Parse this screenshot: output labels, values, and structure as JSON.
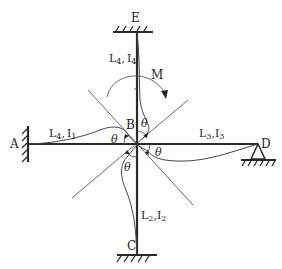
{
  "diagram": {
    "nodes": {
      "A": {
        "label": "A",
        "support": "fixed"
      },
      "B": {
        "label": "B",
        "support": "rigid joint"
      },
      "C": {
        "label": "C",
        "support": "fixed"
      },
      "D": {
        "label": "D",
        "support": "pin"
      },
      "E": {
        "label": "E",
        "support": "fixed"
      }
    },
    "members": {
      "AB": {
        "label": "L₁, I₁",
        "l_sub": "1",
        "i_sub": "1"
      },
      "BC": {
        "label": "L₂, I₂",
        "l_sub": "2",
        "i_sub": "2"
      },
      "BD": {
        "label": "L₃, I₃",
        "l_sub": "3",
        "i_sub": "3"
      },
      "BE": {
        "label": "L₄, I₄",
        "l_sub": "4",
        "i_sub": "4"
      }
    },
    "labels": {
      "A": "A",
      "B": "B",
      "C": "C",
      "D": "D",
      "E": "E",
      "moment": "M",
      "theta": "θ",
      "L": "L",
      "I": "I",
      "comma": ",",
      "sub1": "1",
      "sub2": "2",
      "sub3": "3",
      "sub4": "4"
    },
    "rotation_angle": "θ",
    "applied_moment": "M",
    "moment_direction": "clockwise"
  }
}
